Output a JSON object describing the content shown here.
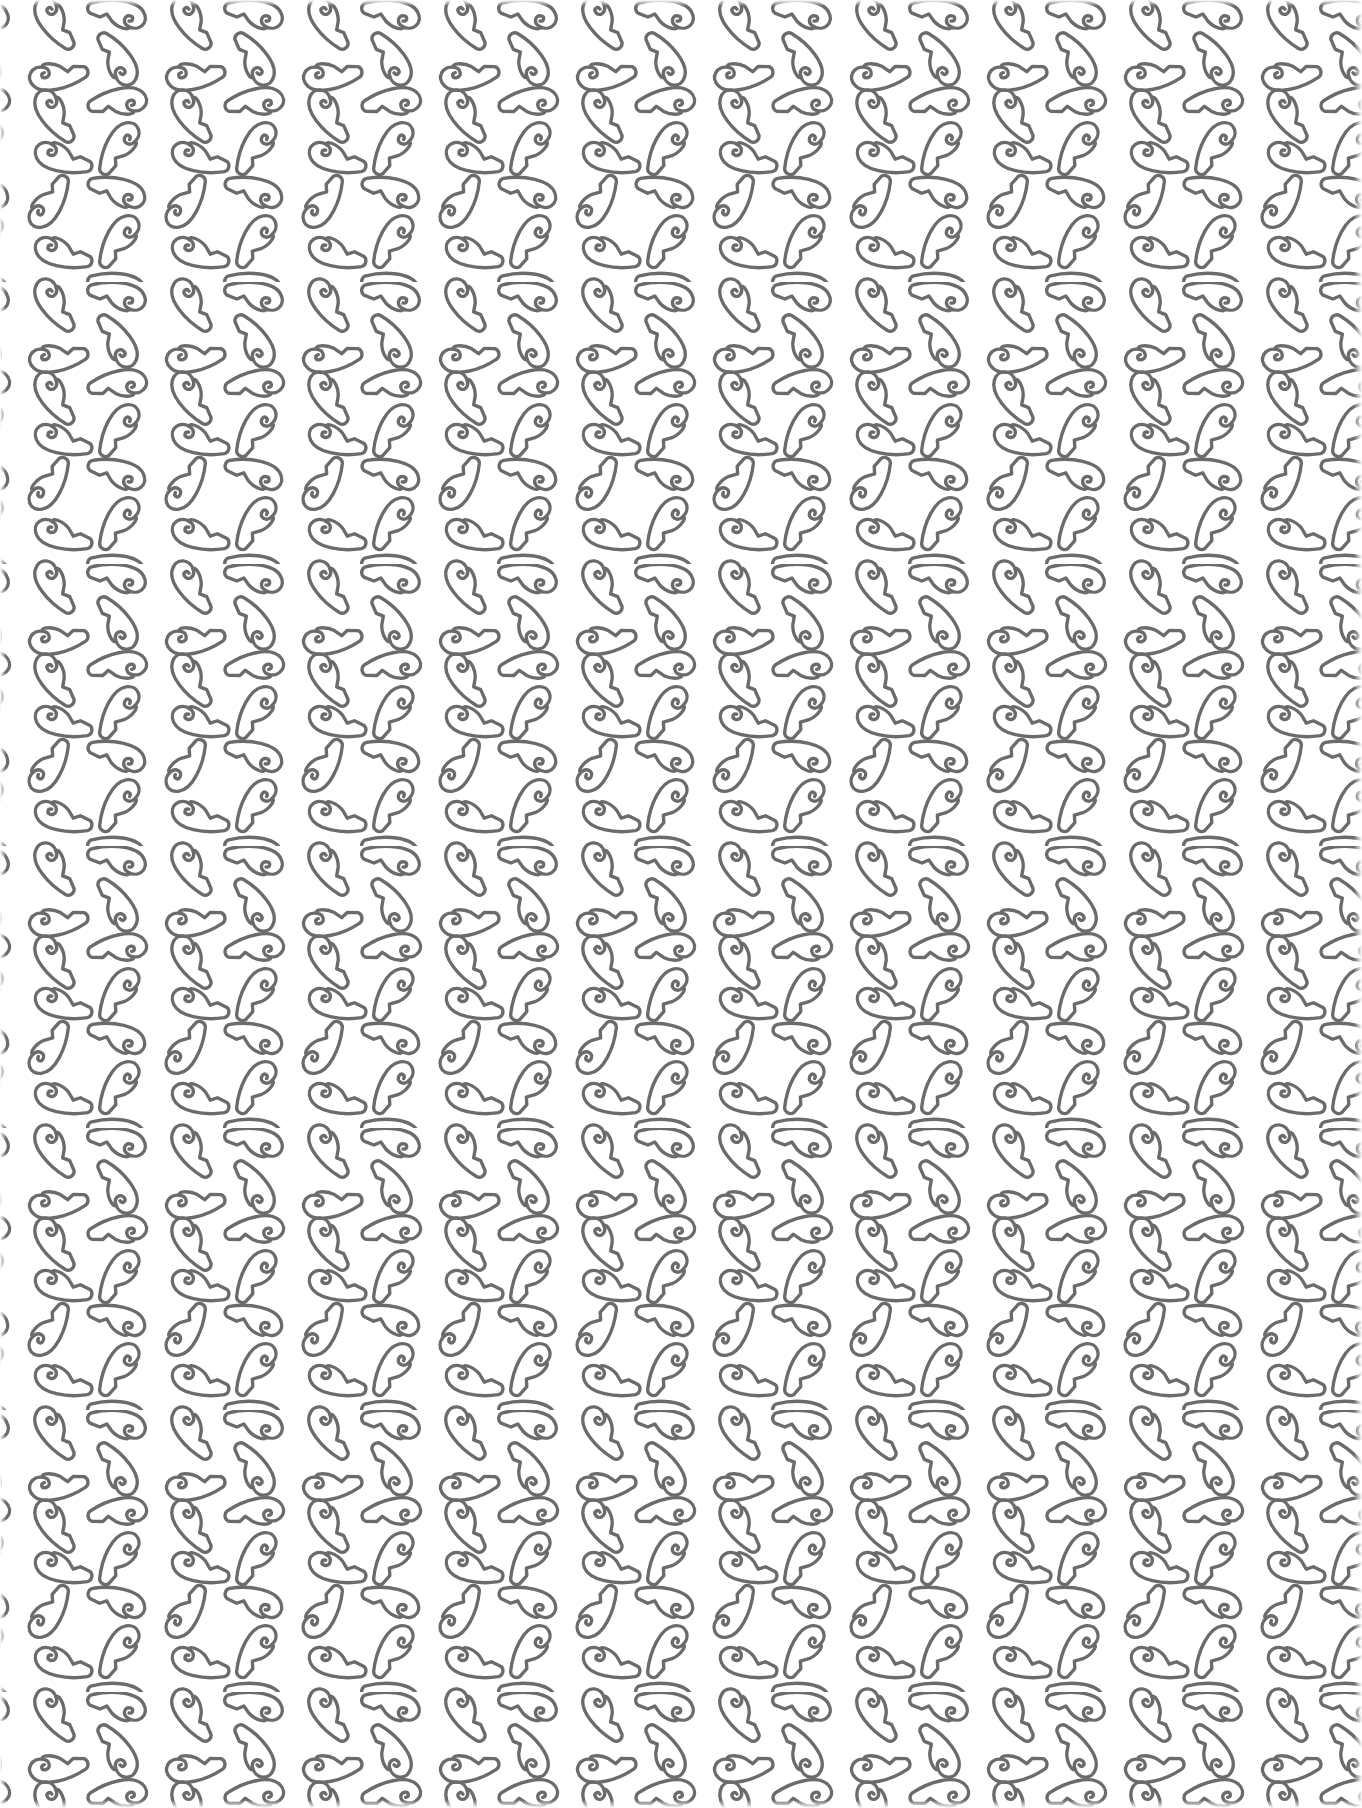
{
  "pattern": {
    "description": "Repeating outlined paisley / leaf motif pattern",
    "motif_icon": "paisley-leaf-icon",
    "stroke_color": "#6b6b6b",
    "background_color": "#ffffff",
    "tile_width": 137,
    "tile_height": 282,
    "stroke_width": 3.2
  }
}
